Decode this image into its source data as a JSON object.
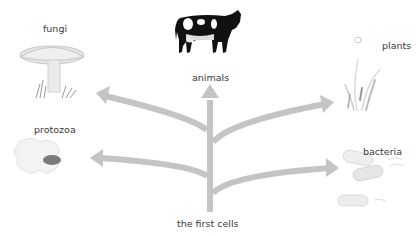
{
  "diagram": {
    "root": {
      "label": "the first cells"
    },
    "branches": [
      {
        "id": "fungi",
        "label": "fungi",
        "direction": "upper-left"
      },
      {
        "id": "animals",
        "label": "animals",
        "direction": "up"
      },
      {
        "id": "plants",
        "label": "plants",
        "direction": "upper-right"
      },
      {
        "id": "protozoa",
        "label": "protozoa",
        "direction": "lower-left"
      },
      {
        "id": "bacteria",
        "label": "bacteria",
        "direction": "lower-right"
      }
    ],
    "colors": {
      "arrow": "#c4c4c4",
      "text": "#3a3a3a",
      "cow_black": "#111111",
      "illustration_gray": "#d8d8d8"
    }
  }
}
